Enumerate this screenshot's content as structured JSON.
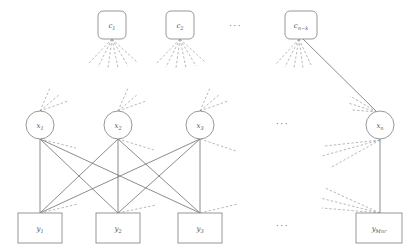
{
  "figure": {
    "type": "factor-graph",
    "colors": {
      "stroke": "#8c8c8c",
      "solid_edge": "#6e6e6e",
      "dashed_edge": "#9a9a9a",
      "label": "#555555",
      "background": "#ffffff"
    }
  },
  "check_nodes": {
    "shape": "rounded-rect",
    "items": [
      {
        "id": "c1",
        "base": "c",
        "sub": "1",
        "x": 112,
        "y": 25
      },
      {
        "id": "c2",
        "base": "c",
        "sub": "2",
        "x": 180,
        "y": 25
      },
      {
        "id": "cnk",
        "base": "c",
        "sub": "n−k",
        "x": 301,
        "y": 25
      }
    ],
    "ellipsis": "···"
  },
  "variable_nodes": {
    "shape": "circle",
    "items": [
      {
        "id": "x1",
        "base": "x",
        "sub": "1",
        "x": 40,
        "y": 125
      },
      {
        "id": "x2",
        "base": "x",
        "sub": "2",
        "x": 118,
        "y": 125
      },
      {
        "id": "x3",
        "base": "x",
        "sub": "3",
        "x": 200,
        "y": 125
      },
      {
        "id": "xn",
        "base": "x",
        "sub": "n",
        "x": 380,
        "y": 125
      }
    ],
    "ellipsis": "···"
  },
  "output_nodes": {
    "shape": "square",
    "items": [
      {
        "id": "y1",
        "base": "y",
        "sub": "1",
        "x": 40,
        "y": 227
      },
      {
        "id": "y2",
        "base": "y",
        "sub": "2",
        "x": 118,
        "y": 227
      },
      {
        "id": "y3",
        "base": "y",
        "sub": "3",
        "x": 200,
        "y": 227
      },
      {
        "id": "yMnr",
        "base": "y",
        "sub": "Mnr",
        "x": 380,
        "y": 227
      }
    ],
    "ellipsis": "···"
  },
  "edges": {
    "solid_description": "complete bipartite connections between x1,x2,x3 and y1,y2,y3; vertical edge xn to yMnr; edge from c(n-k) to xn",
    "dashed_description": "dashed stub fans indicating omitted connections"
  }
}
